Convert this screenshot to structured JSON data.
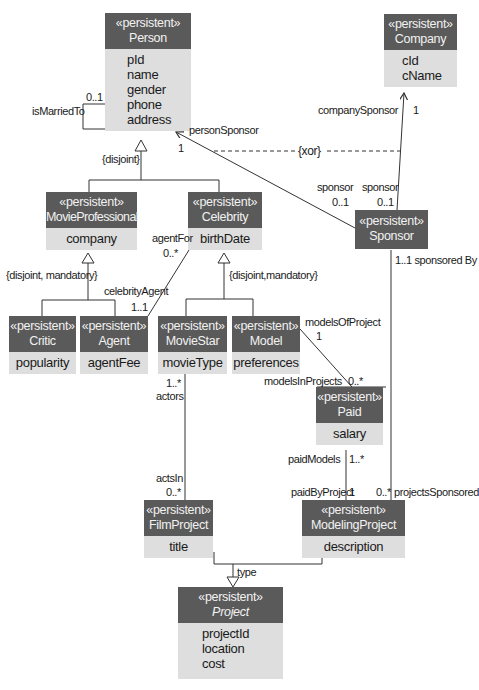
{
  "stereotype": "«persistent»",
  "classes": {
    "person": {
      "name": "Person",
      "attributes": [
        "pId",
        "name",
        "gender",
        "phone",
        "address"
      ]
    },
    "company": {
      "name": "Company",
      "attributes": [
        "cId",
        "cName"
      ]
    },
    "movie_professional": {
      "name": "MovieProfessional",
      "attributes": [
        "company"
      ]
    },
    "celebrity": {
      "name": "Celebrity",
      "attributes": [
        "birthDate"
      ]
    },
    "sponsor": {
      "name": "Sponsor",
      "attributes": []
    },
    "critic": {
      "name": "Critic",
      "attributes": [
        "popularity"
      ]
    },
    "agent": {
      "name": "Agent",
      "attributes": [
        "agentFee"
      ]
    },
    "movie_star": {
      "name": "MovieStar",
      "attributes": [
        "movieType"
      ]
    },
    "model": {
      "name": "Model",
      "attributes": [
        "preferences"
      ]
    },
    "paid": {
      "name": "Paid",
      "attributes": [
        "salary"
      ]
    },
    "film_project": {
      "name": "FilmProject",
      "attributes": [
        "title"
      ]
    },
    "modeling_project": {
      "name": "ModelingProject",
      "attributes": [
        "description"
      ]
    },
    "project": {
      "name": "Project",
      "abstract": true,
      "attributes": [
        "projectId",
        "location",
        "cost"
      ]
    }
  },
  "labels": {
    "is_married_to": "isMarriedTo",
    "married_mult": "0..1",
    "disjoint": "{disjoint}",
    "disjoint_mandatory_left": "{disjoint, mandatory}",
    "disjoint_mandatory_right": "{disjoint,mandatory}",
    "person_sponsor": "personSponsor",
    "person_sponsor_mult": "1",
    "company_sponsor": "companySponsor",
    "company_sponsor_mult": "1",
    "xor": "{xor}",
    "sponsor_role_1": "sponsor",
    "sponsor_mult_1": "0..1",
    "sponsor_role_2": "sponsor",
    "sponsor_mult_2": "0..1",
    "agent_for": "agentFor",
    "agent_for_mult": "0..*",
    "celebrity_agent": "celebrityAgent",
    "celebrity_agent_mult": "1..1",
    "sponsored_by": "1..1 sponsored By",
    "models_of_project": "modelsOfProject",
    "models_of_project_mult": "1",
    "models_in_projects": "modelsInProjects",
    "models_in_projects_mult": "0..*",
    "actors_mult": "1..*",
    "actors": "actors",
    "acts_in": "actsIn",
    "acts_in_mult": "0..*",
    "paid_models": "paidModels",
    "paid_models_mult": "1..*",
    "paid_by_project": "paidByProject",
    "paid_by_project_mult": "1",
    "projects_sponsored_mult": "0..*",
    "projects_sponsored": "projectsSponsored",
    "type": "type"
  },
  "colors": {
    "header": "#5a5a5a",
    "body": "#dedede",
    "line": "#333333"
  }
}
